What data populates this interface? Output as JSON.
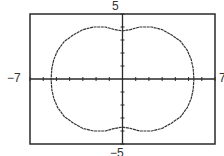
{
  "chart_data": {
    "type": "line",
    "subtype": "polar-curve-plot",
    "title": "",
    "xlabel": "",
    "ylabel": "",
    "xlim": [
      -7,
      7
    ],
    "ylim": [
      -5,
      5
    ],
    "x_tick_step": 1,
    "y_tick_step": 1,
    "grid": false,
    "window_labels": {
      "ymax": "5",
      "ymin": "−5",
      "xmin": "−7",
      "xmax": "7"
    },
    "series": [
      {
        "name": "curve",
        "closed": true,
        "points": [
          [
            5.4,
            0
          ],
          [
            5.35,
            0.8
          ],
          [
            5.2,
            1.5
          ],
          [
            4.9,
            2.2
          ],
          [
            4.4,
            2.9
          ],
          [
            3.7,
            3.4
          ],
          [
            3.0,
            3.8
          ],
          [
            2.2,
            4.0
          ],
          [
            1.3,
            4.0
          ],
          [
            0.6,
            3.8
          ],
          [
            0,
            3.7
          ],
          [
            -0.6,
            3.8
          ],
          [
            -1.3,
            4.0
          ],
          [
            -2.2,
            4.0
          ],
          [
            -3.0,
            3.8
          ],
          [
            -3.7,
            3.4
          ],
          [
            -4.4,
            2.9
          ],
          [
            -4.9,
            2.2
          ],
          [
            -5.2,
            1.5
          ],
          [
            -5.35,
            0.8
          ],
          [
            -5.4,
            0
          ],
          [
            -5.35,
            -0.8
          ],
          [
            -5.2,
            -1.5
          ],
          [
            -4.9,
            -2.2
          ],
          [
            -4.4,
            -2.9
          ],
          [
            -3.7,
            -3.4
          ],
          [
            -3.0,
            -3.8
          ],
          [
            -2.2,
            -4.0
          ],
          [
            -1.3,
            -4.0
          ],
          [
            -0.6,
            -3.8
          ],
          [
            0,
            -3.7
          ],
          [
            0.6,
            -3.8
          ],
          [
            1.3,
            -4.0
          ],
          [
            2.2,
            -4.0
          ],
          [
            3.0,
            -3.8
          ],
          [
            3.7,
            -3.4
          ],
          [
            4.4,
            -2.9
          ],
          [
            4.9,
            -2.2
          ],
          [
            5.2,
            -1.5
          ],
          [
            5.35,
            -0.8
          ]
        ]
      }
    ]
  },
  "colors": {
    "frame": "#2a2a2a",
    "axes": "#2a2a2a",
    "curve": "#333333",
    "background": "#ffffff"
  }
}
